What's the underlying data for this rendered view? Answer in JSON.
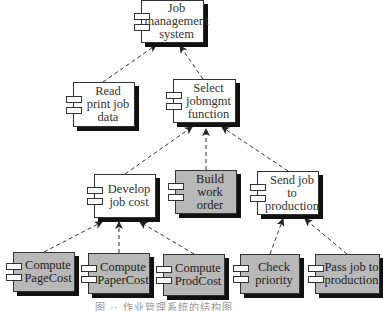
{
  "diagram": {
    "nodes": [
      {
        "id": "job_mgmt",
        "label": "Job\nmanagement\nsystem",
        "fill": "#ffffff",
        "x": 141,
        "y": 0,
        "w": 63,
        "h": 43
      },
      {
        "id": "read_print",
        "label": "Read\nprint job\ndata",
        "fill": "#ffffff",
        "x": 73,
        "y": 82,
        "w": 62,
        "h": 45
      },
      {
        "id": "select_fn",
        "label": "Select\njobmgmt\nfunction",
        "fill": "#ffffff",
        "x": 173,
        "y": 79,
        "w": 63,
        "h": 44
      },
      {
        "id": "develop_cost",
        "label": "Develop\njob cost",
        "fill": "#ffffff",
        "x": 94,
        "y": 174,
        "w": 62,
        "h": 44
      },
      {
        "id": "build_order",
        "label": "Build\nwork order",
        "fill": "#b8b8b8",
        "x": 175,
        "y": 170,
        "w": 62,
        "h": 44
      },
      {
        "id": "send_job",
        "label": "Send job\nto\nproduction",
        "fill": "#ffffff",
        "x": 257,
        "y": 171,
        "w": 62,
        "h": 44
      },
      {
        "id": "page_cost",
        "label": "Compute\nPageCost",
        "fill": "#b8b8b8",
        "x": 13,
        "y": 252,
        "w": 62,
        "h": 40
      },
      {
        "id": "paper_cost",
        "label": "Compute\nPaperCost",
        "fill": "#b8b8b8",
        "x": 88,
        "y": 253,
        "w": 62,
        "h": 41
      },
      {
        "id": "prod_cost",
        "label": "Compute\nProdCost",
        "fill": "#b8b8b8",
        "x": 163,
        "y": 254,
        "w": 62,
        "h": 42
      },
      {
        "id": "check_priority",
        "label": "Check\npriority",
        "fill": "#b8b8b8",
        "x": 240,
        "y": 254,
        "w": 60,
        "h": 40
      },
      {
        "id": "pass_job",
        "label": "Pass job to\nproduction",
        "fill": "#b8b8b8",
        "x": 315,
        "y": 254,
        "w": 65,
        "h": 40
      }
    ],
    "edges": [
      {
        "from": "read_print",
        "to": "job_mgmt",
        "x1": 103,
        "y1": 82,
        "x2": 156,
        "y2": 45
      },
      {
        "from": "select_fn",
        "to": "job_mgmt",
        "x1": 203,
        "y1": 79,
        "x2": 180,
        "y2": 46
      },
      {
        "from": "develop_cost",
        "to": "select_fn",
        "x1": 125,
        "y1": 174,
        "x2": 192,
        "y2": 127
      },
      {
        "from": "build_order",
        "to": "select_fn",
        "x1": 206,
        "y1": 170,
        "x2": 206,
        "y2": 129
      },
      {
        "from": "send_job",
        "to": "select_fn",
        "x1": 288,
        "y1": 171,
        "x2": 222,
        "y2": 127
      },
      {
        "from": "page_cost",
        "to": "develop_cost",
        "x1": 44,
        "y1": 252,
        "x2": 102,
        "y2": 222
      },
      {
        "from": "paper_cost",
        "to": "develop_cost",
        "x1": 119,
        "y1": 253,
        "x2": 119,
        "y2": 222
      },
      {
        "from": "prod_cost",
        "to": "develop_cost",
        "x1": 194,
        "y1": 254,
        "x2": 140,
        "y2": 222
      },
      {
        "from": "check_priority",
        "to": "send_job",
        "x1": 270,
        "y1": 254,
        "x2": 283,
        "y2": 219
      },
      {
        "from": "pass_job",
        "to": "send_job",
        "x1": 347,
        "y1": 254,
        "x2": 305,
        "y2": 219
      }
    ],
    "caption": "图 ·· 作业管理系统的结构图"
  }
}
